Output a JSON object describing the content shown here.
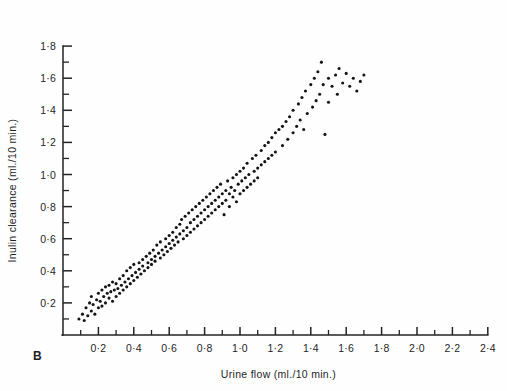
{
  "figure": {
    "panel_label": "B",
    "background": "#fefefe",
    "point_color": "#141414",
    "axis_color": "#232323"
  },
  "chart_data": {
    "type": "scatter",
    "title": "",
    "xlabel": "Urine flow (ml./10 min.)",
    "ylabel": "Inulin clearance (ml./10 min.)",
    "xlim": [
      0.0,
      2.4
    ],
    "ylim": [
      0.0,
      1.8
    ],
    "grid": false,
    "legend": null,
    "x_major_tick_labels": [
      "0·2",
      "0·4",
      "0·6",
      "0·8",
      "1·0",
      "1·2",
      "1·4",
      "1·6",
      "1·8",
      "2·0",
      "2·2",
      "2·4"
    ],
    "x_major_tick_values": [
      0.2,
      0.4,
      0.6,
      0.8,
      1.0,
      1.2,
      1.4,
      1.6,
      1.8,
      2.0,
      2.2,
      2.4
    ],
    "x_minor_tick_values": [
      0.1,
      0.3,
      0.5,
      0.7,
      0.9,
      1.1,
      1.3,
      1.5,
      1.7,
      1.9,
      2.1,
      2.3
    ],
    "y_major_tick_labels": [
      "0·2",
      "0·4",
      "0·6",
      "0·8",
      "1·0",
      "1·2",
      "1·4",
      "1·6",
      "1·8"
    ],
    "y_major_tick_values": [
      0.2,
      0.4,
      0.6,
      0.8,
      1.0,
      1.2,
      1.4,
      1.6,
      1.8
    ],
    "y_minor_tick_values": [
      0.1,
      0.3,
      0.5,
      0.7,
      0.9,
      1.1,
      1.3,
      1.5,
      1.7
    ],
    "n_points": 192,
    "points": [
      [
        0.09,
        0.1
      ],
      [
        0.11,
        0.13
      ],
      [
        0.12,
        0.09
      ],
      [
        0.13,
        0.17
      ],
      [
        0.14,
        0.12
      ],
      [
        0.15,
        0.2
      ],
      [
        0.16,
        0.15
      ],
      [
        0.16,
        0.24
      ],
      [
        0.17,
        0.19
      ],
      [
        0.18,
        0.13
      ],
      [
        0.19,
        0.22
      ],
      [
        0.2,
        0.17
      ],
      [
        0.2,
        0.26
      ],
      [
        0.21,
        0.21
      ],
      [
        0.22,
        0.28
      ],
      [
        0.22,
        0.18
      ],
      [
        0.23,
        0.24
      ],
      [
        0.24,
        0.3
      ],
      [
        0.24,
        0.2
      ],
      [
        0.25,
        0.26
      ],
      [
        0.26,
        0.23
      ],
      [
        0.26,
        0.31
      ],
      [
        0.27,
        0.27
      ],
      [
        0.28,
        0.21
      ],
      [
        0.28,
        0.33
      ],
      [
        0.29,
        0.28
      ],
      [
        0.3,
        0.24
      ],
      [
        0.3,
        0.32
      ],
      [
        0.31,
        0.29
      ],
      [
        0.32,
        0.35
      ],
      [
        0.32,
        0.26
      ],
      [
        0.33,
        0.31
      ],
      [
        0.34,
        0.37
      ],
      [
        0.34,
        0.28
      ],
      [
        0.35,
        0.33
      ],
      [
        0.36,
        0.3
      ],
      [
        0.36,
        0.4
      ],
      [
        0.37,
        0.35
      ],
      [
        0.38,
        0.32
      ],
      [
        0.38,
        0.42
      ],
      [
        0.39,
        0.37
      ],
      [
        0.4,
        0.34
      ],
      [
        0.4,
        0.44
      ],
      [
        0.41,
        0.39
      ],
      [
        0.42,
        0.36
      ],
      [
        0.43,
        0.45
      ],
      [
        0.43,
        0.41
      ],
      [
        0.44,
        0.38
      ],
      [
        0.45,
        0.47
      ],
      [
        0.45,
        0.43
      ],
      [
        0.46,
        0.4
      ],
      [
        0.47,
        0.49
      ],
      [
        0.48,
        0.45
      ],
      [
        0.48,
        0.42
      ],
      [
        0.49,
        0.51
      ],
      [
        0.5,
        0.47
      ],
      [
        0.5,
        0.44
      ],
      [
        0.51,
        0.53
      ],
      [
        0.52,
        0.49
      ],
      [
        0.52,
        0.46
      ],
      [
        0.53,
        0.56
      ],
      [
        0.54,
        0.51
      ],
      [
        0.55,
        0.48
      ],
      [
        0.55,
        0.58
      ],
      [
        0.56,
        0.53
      ],
      [
        0.57,
        0.5
      ],
      [
        0.58,
        0.6
      ],
      [
        0.58,
        0.55
      ],
      [
        0.59,
        0.52
      ],
      [
        0.6,
        0.62
      ],
      [
        0.6,
        0.57
      ],
      [
        0.61,
        0.54
      ],
      [
        0.62,
        0.64
      ],
      [
        0.62,
        0.59
      ],
      [
        0.63,
        0.56
      ],
      [
        0.64,
        0.67
      ],
      [
        0.64,
        0.61
      ],
      [
        0.65,
        0.58
      ],
      [
        0.66,
        0.69
      ],
      [
        0.66,
        0.63
      ],
      [
        0.67,
        0.72
      ],
      [
        0.68,
        0.65
      ],
      [
        0.68,
        0.6
      ],
      [
        0.69,
        0.74
      ],
      [
        0.7,
        0.67
      ],
      [
        0.7,
        0.62
      ],
      [
        0.71,
        0.76
      ],
      [
        0.72,
        0.7
      ],
      [
        0.72,
        0.64
      ],
      [
        0.73,
        0.78
      ],
      [
        0.74,
        0.72
      ],
      [
        0.74,
        0.66
      ],
      [
        0.75,
        0.8
      ],
      [
        0.76,
        0.74
      ],
      [
        0.76,
        0.68
      ],
      [
        0.77,
        0.82
      ],
      [
        0.78,
        0.76
      ],
      [
        0.78,
        0.7
      ],
      [
        0.79,
        0.84
      ],
      [
        0.8,
        0.78
      ],
      [
        0.8,
        0.72
      ],
      [
        0.81,
        0.86
      ],
      [
        0.82,
        0.8
      ],
      [
        0.82,
        0.74
      ],
      [
        0.83,
        0.88
      ],
      [
        0.84,
        0.82
      ],
      [
        0.84,
        0.76
      ],
      [
        0.85,
        0.9
      ],
      [
        0.86,
        0.84
      ],
      [
        0.86,
        0.78
      ],
      [
        0.87,
        0.92
      ],
      [
        0.88,
        0.86
      ],
      [
        0.88,
        0.8
      ],
      [
        0.89,
        0.94
      ],
      [
        0.9,
        0.88
      ],
      [
        0.9,
        0.82
      ],
      [
        0.91,
        0.75
      ],
      [
        0.92,
        0.9
      ],
      [
        0.92,
        0.84
      ],
      [
        0.93,
        0.96
      ],
      [
        0.94,
        0.88
      ],
      [
        0.94,
        0.8
      ],
      [
        0.95,
        0.92
      ],
      [
        0.96,
        0.86
      ],
      [
        0.96,
        0.98
      ],
      [
        0.97,
        0.9
      ],
      [
        0.98,
        0.83
      ],
      [
        0.98,
        1.0
      ],
      [
        0.99,
        0.94
      ],
      [
        1.0,
        0.88
      ],
      [
        1.0,
        1.02
      ],
      [
        1.01,
        0.96
      ],
      [
        1.02,
        0.9
      ],
      [
        1.02,
        1.04
      ],
      [
        1.03,
        0.98
      ],
      [
        1.04,
        0.92
      ],
      [
        1.04,
        1.07
      ],
      [
        1.05,
        1.0
      ],
      [
        1.06,
        0.94
      ],
      [
        1.07,
        1.1
      ],
      [
        1.08,
        1.02
      ],
      [
        1.08,
        0.96
      ],
      [
        1.09,
        1.12
      ],
      [
        1.1,
        1.04
      ],
      [
        1.1,
        0.98
      ],
      [
        1.12,
        1.15
      ],
      [
        1.12,
        1.06
      ],
      [
        1.14,
        1.18
      ],
      [
        1.14,
        1.08
      ],
      [
        1.16,
        1.2
      ],
      [
        1.16,
        1.1
      ],
      [
        1.18,
        1.23
      ],
      [
        1.18,
        1.12
      ],
      [
        1.2,
        1.26
      ],
      [
        1.2,
        1.14
      ],
      [
        1.22,
        1.28
      ],
      [
        1.24,
        1.3
      ],
      [
        1.24,
        1.18
      ],
      [
        1.26,
        1.33
      ],
      [
        1.27,
        1.22
      ],
      [
        1.28,
        1.36
      ],
      [
        1.3,
        1.26
      ],
      [
        1.3,
        1.4
      ],
      [
        1.32,
        1.3
      ],
      [
        1.33,
        1.44
      ],
      [
        1.34,
        1.34
      ],
      [
        1.35,
        1.48
      ],
      [
        1.36,
        1.28
      ],
      [
        1.37,
        1.52
      ],
      [
        1.38,
        1.38
      ],
      [
        1.4,
        1.56
      ],
      [
        1.41,
        1.42
      ],
      [
        1.42,
        1.6
      ],
      [
        1.43,
        1.46
      ],
      [
        1.44,
        1.64
      ],
      [
        1.45,
        1.5
      ],
      [
        1.46,
        1.7
      ],
      [
        1.47,
        1.56
      ],
      [
        1.48,
        1.25
      ],
      [
        1.5,
        1.6
      ],
      [
        1.5,
        1.45
      ],
      [
        1.52,
        1.55
      ],
      [
        1.54,
        1.62
      ],
      [
        1.55,
        1.5
      ],
      [
        1.56,
        1.66
      ],
      [
        1.58,
        1.57
      ],
      [
        1.6,
        1.63
      ],
      [
        1.62,
        1.55
      ],
      [
        1.64,
        1.6
      ],
      [
        1.66,
        1.52
      ],
      [
        1.68,
        1.58
      ],
      [
        1.7,
        1.62
      ]
    ]
  }
}
